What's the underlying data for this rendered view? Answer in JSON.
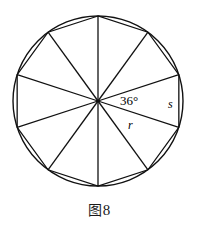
{
  "figure": {
    "type": "geometry-diagram",
    "caption_glyph": "图",
    "caption_number": "8",
    "labels": {
      "central_angle": "36°",
      "side": "s",
      "radius": "r"
    },
    "geometry": {
      "center_x": 98,
      "center_y": 101,
      "radius": 85,
      "sides": 10,
      "central_angle_degrees": 36,
      "start_angle_degrees": 90,
      "stroke_color": "#111111",
      "circle_stroke_width": 1.4,
      "polygon_stroke_width": 1.3,
      "spoke_stroke_width": 1.3,
      "background_color": "#ffffff"
    }
  }
}
